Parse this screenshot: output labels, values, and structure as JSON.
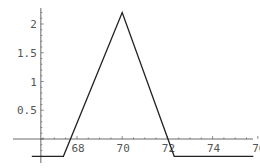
{
  "chart_data": {
    "type": "line",
    "title": "",
    "xlabel": "",
    "ylabel": "",
    "x": [
      66.0,
      67.4,
      70.0,
      72.3,
      75.8
    ],
    "series": [
      {
        "name": "piecewise",
        "x": [
          66.0,
          67.4,
          70.0,
          72.3,
          75.8
        ],
        "y": [
          -0.3,
          -0.3,
          2.2,
          -0.3,
          -0.3
        ]
      }
    ],
    "xticks": [
      68,
      70,
      72,
      74,
      76
    ],
    "xtick_labels": [
      "68",
      "70",
      "72",
      "74",
      "76"
    ],
    "yticks": [
      0.5,
      1,
      1.5,
      2
    ],
    "ytick_labels": [
      "0.5",
      "1",
      "1.5",
      "2"
    ],
    "xlim": [
      65.9,
      76.2
    ],
    "ylim": [
      -0.42,
      2.3
    ],
    "axes_origin": {
      "x": 66.4,
      "y": 0
    },
    "grid": false,
    "legend": "none",
    "colors": {
      "line": "#222222",
      "axis": "#444444",
      "tick_label": "#555555"
    }
  }
}
